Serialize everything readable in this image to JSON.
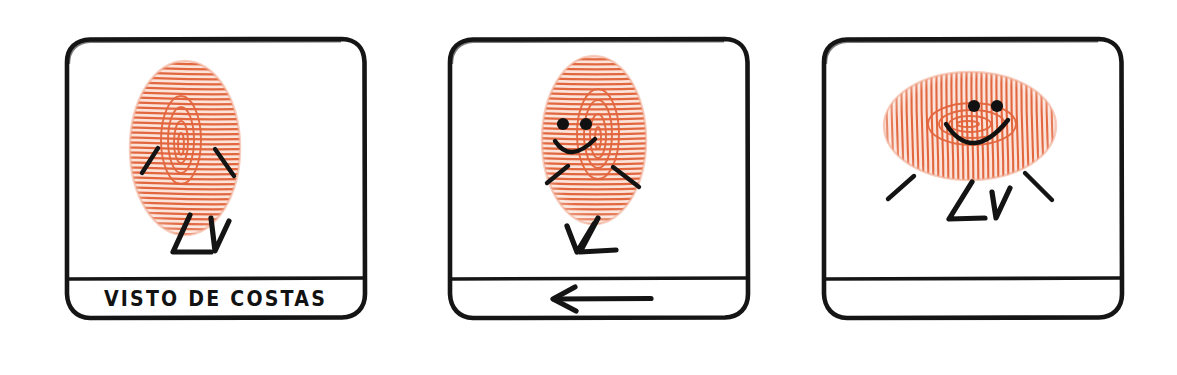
{
  "artwork": {
    "title": "Fingerprint character comic strip",
    "medium": "hand-drawn ink and fingerprint ink illustration",
    "background_color": "#FFFFFF",
    "ink_color": "#1A1A1A",
    "fingerprint_color": "#E8714A",
    "fingerprint_color_light": "#F2A88C"
  },
  "panels": [
    {
      "id": "panel-1",
      "index": "1",
      "caption": "VISTO DE COSTAS",
      "caption_kind": "text",
      "character": {
        "body": "vertical-fingerprint",
        "orientation": "upright",
        "face_visible": "false",
        "arms": "two",
        "legs": "walking-zigzag"
      }
    },
    {
      "id": "panel-2",
      "index": "2",
      "caption": "",
      "caption_kind": "arrow",
      "caption_icon": "arrow-left-icon",
      "character": {
        "body": "vertical-fingerprint",
        "orientation": "upright-turning",
        "face_visible": "true",
        "arms": "two",
        "legs": "walking-zigzag"
      }
    },
    {
      "id": "panel-3",
      "index": "3",
      "caption": "",
      "caption_kind": "empty",
      "character": {
        "body": "horizontal-fingerprint",
        "orientation": "rotated-sideways",
        "face_visible": "true",
        "arms": "two",
        "legs": "walking-zigzag"
      }
    }
  ]
}
